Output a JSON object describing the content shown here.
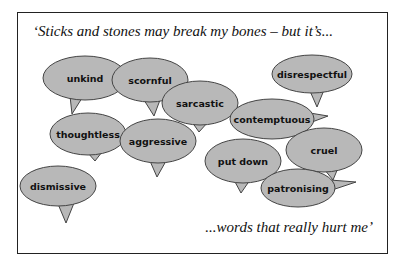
{
  "quote": {
    "top": "‘Sticks and stones may break my bones – but it’s...",
    "bottom": "...words that really hurt me’"
  },
  "bubble_style": {
    "fill": "#b8b8b8",
    "stroke": "#444444"
  },
  "bubbles": [
    {
      "label": "unkind",
      "cx": 85,
      "cy": 78,
      "rx": 42,
      "ry": 22,
      "tail": [
        [
          70,
          96
        ],
        [
          82,
          98
        ],
        [
          72,
          114
        ]
      ]
    },
    {
      "label": "scornful",
      "cx": 150,
      "cy": 80,
      "rx": 38,
      "ry": 22,
      "tail": [
        [
          144,
          100
        ],
        [
          160,
          100
        ],
        [
          154,
          116
        ]
      ]
    },
    {
      "label": "sarcastic",
      "cx": 200,
      "cy": 103,
      "rx": 38,
      "ry": 22,
      "tail": [
        [
          192,
          122
        ],
        [
          208,
          122
        ],
        [
          199,
          132
        ]
      ]
    },
    {
      "label": "disrespectful",
      "cx": 312,
      "cy": 74,
      "rx": 40,
      "ry": 19,
      "tail": [
        [
          310,
          91
        ],
        [
          324,
          90
        ],
        [
          317,
          107
        ]
      ]
    },
    {
      "label": "thoughtless",
      "cx": 88,
      "cy": 134,
      "rx": 38,
      "ry": 21,
      "tail": [
        [
          88,
          153
        ],
        [
          102,
          152
        ],
        [
          95,
          161
        ]
      ]
    },
    {
      "label": "aggressive",
      "cx": 158,
      "cy": 141,
      "rx": 38,
      "ry": 22,
      "tail": [
        [
          150,
          161
        ],
        [
          166,
          161
        ],
        [
          157,
          177
        ]
      ]
    },
    {
      "label": "contemptuous",
      "cx": 272,
      "cy": 119,
      "rx": 42,
      "ry": 20,
      "tail": [
        [
          310,
          113
        ],
        [
          312,
          122
        ],
        [
          328,
          116
        ]
      ]
    },
    {
      "label": "put down",
      "cx": 243,
      "cy": 161,
      "rx": 38,
      "ry": 22,
      "tail": [
        [
          234,
          180
        ],
        [
          250,
          180
        ],
        [
          241,
          193
        ]
      ]
    },
    {
      "label": "cruel",
      "cx": 324,
      "cy": 150,
      "rx": 38,
      "ry": 22,
      "tail": [
        [
          324,
          169
        ],
        [
          338,
          168
        ],
        [
          333,
          180
        ]
      ]
    },
    {
      "label": "patronising",
      "cx": 298,
      "cy": 188,
      "rx": 37,
      "ry": 19,
      "tail": [
        [
          330,
          180
        ],
        [
          332,
          190
        ],
        [
          356,
          182
        ]
      ]
    },
    {
      "label": "dismissive",
      "cx": 58,
      "cy": 186,
      "rx": 38,
      "ry": 20,
      "tail": [
        [
          58,
          204
        ],
        [
          74,
          203
        ],
        [
          66,
          223
        ]
      ]
    }
  ]
}
